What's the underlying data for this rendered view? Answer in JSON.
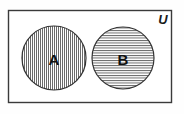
{
  "diagram": {
    "type": "venn-diagram",
    "universe": {
      "label": "U",
      "shape": "rectangle",
      "x": 8,
      "y": 10,
      "width": 164,
      "height": 93,
      "stroke_color": "#3a3a3a",
      "fill_color": "#ffffff",
      "label_x": 163,
      "label_y": 19
    },
    "sets": [
      {
        "name": "set-a",
        "label": "A",
        "cx": 54,
        "cy": 58,
        "r": 32,
        "fill_pattern": "vertical-hatch",
        "pattern_spacing": 2,
        "stroke_color": "#333333",
        "hatch_color": "#555555"
      },
      {
        "name": "set-b",
        "label": "B",
        "cx": 123,
        "cy": 58,
        "r": 31,
        "fill_pattern": "horizontal-hatch",
        "pattern_spacing": 2.5,
        "stroke_color": "#333333",
        "hatch_color": "#555555"
      }
    ],
    "relationship": "disjoint",
    "colors": {
      "background": "#ffffff",
      "outline": "#3a3a3a",
      "text": "#111111"
    }
  }
}
